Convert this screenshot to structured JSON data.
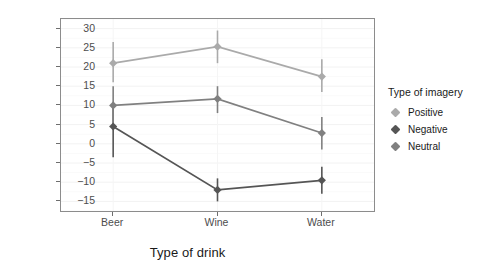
{
  "chart_data": {
    "type": "line",
    "title": "",
    "xlabel": "Type of drink",
    "ylabel": "Mean attitude rating",
    "categories": [
      "Beer",
      "Wine",
      "Water"
    ],
    "ylim": [
      -17.5,
      32.5
    ],
    "yticks": [
      30,
      25,
      20,
      15,
      10,
      5,
      0,
      -5,
      -10,
      -15
    ],
    "ytick_labels": [
      "30",
      "25",
      "20",
      "15",
      "10",
      "5",
      "0",
      "−5",
      "−10",
      "−15"
    ],
    "grid": true,
    "legend": {
      "title": "Type of imagery",
      "position": "right",
      "entries": [
        {
          "name": "Positive",
          "color": "#aaaaaa"
        },
        {
          "name": "Negative",
          "color": "#555555"
        },
        {
          "name": "Neutral",
          "color": "#808080"
        }
      ]
    },
    "series": [
      {
        "name": "Positive",
        "color": "#aaaaaa",
        "values": [
          21.0,
          25.3,
          17.5
        ],
        "error_low": [
          16.0,
          21.0,
          13.5
        ],
        "error_high": [
          26.5,
          29.5,
          22.0
        ]
      },
      {
        "name": "Negative",
        "color": "#555555",
        "values": [
          4.5,
          -12.0,
          -9.5
        ],
        "error_low": [
          -3.5,
          -15.0,
          -13.0
        ],
        "error_high": [
          9.5,
          -9.0,
          -6.0
        ]
      },
      {
        "name": "Neutral",
        "color": "#808080",
        "values": [
          10.0,
          11.7,
          2.8
        ],
        "error_low": [
          4.5,
          8.0,
          -1.5
        ],
        "error_high": [
          15.0,
          15.0,
          7.0
        ]
      }
    ]
  }
}
